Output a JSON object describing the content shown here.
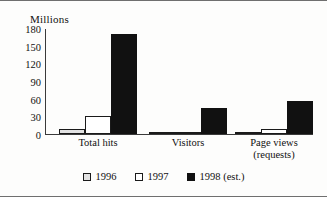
{
  "chart_data": {
    "type": "bar",
    "title": "",
    "subtitle": "",
    "unit_label": "Millions",
    "xlabel": "",
    "ylabel": "Millions",
    "ylim": [
      0,
      180
    ],
    "yticks": [
      180,
      150,
      120,
      90,
      60,
      30,
      0
    ],
    "grid": false,
    "legend_position": "bottom-center",
    "categories": [
      "Total hits",
      "Visitors",
      "Page views"
    ],
    "category_sublabels": [
      "",
      "",
      "(requests)"
    ],
    "series": [
      {
        "name": "1996",
        "swatch": "light-gray",
        "values": [
          8,
          1,
          1
        ]
      },
      {
        "name": "1997",
        "swatch": "white",
        "values": [
          31,
          3,
          8
        ]
      },
      {
        "name": "1998 (est.)",
        "swatch": "black",
        "values": [
          171,
          45,
          57
        ]
      }
    ]
  },
  "colors": {
    "series_1996": "#e2e2e2",
    "series_1997": "#ffffff",
    "series_1998": "#111111",
    "axis": "#3a3a3a",
    "text": "#111111",
    "background": "#fdfdfc",
    "frame": "#6f6f6f"
  }
}
